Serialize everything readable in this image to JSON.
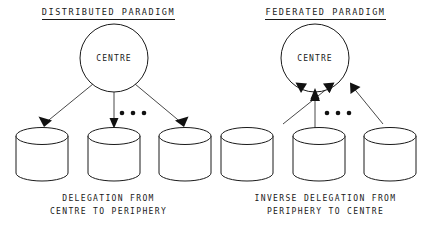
{
  "figure": {
    "background_color": "#ffffff",
    "line_color": "#1a1a1a"
  },
  "panels": [
    {
      "id": "distributed",
      "title": "DISTRIBUTED PARADIGM",
      "centre_label": "CENTRE",
      "caption_line1": "DELEGATION FROM",
      "caption_line2": "CENTRE TO PERIPHERY",
      "arrow_direction": "centre-to-periphery",
      "node_count": 3,
      "ellipsis": "• • •"
    },
    {
      "id": "federated",
      "title": "FEDERATED PARADIGM",
      "centre_label": "CENTRE",
      "caption_line1": "INVERSE DELEGATION FROM",
      "caption_line2": "PERIPHERY TO CENTRE",
      "arrow_direction": "periphery-to-centre",
      "node_count": 3,
      "ellipsis": "• • •"
    }
  ]
}
